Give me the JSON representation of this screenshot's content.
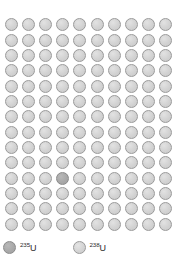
{
  "figure": {
    "grid": {
      "rows": 14,
      "columns": 10,
      "total_atoms": 140,
      "u235_count": 1,
      "u238_count": 139,
      "u235_position": {
        "row": 11,
        "column": 4
      },
      "u235_index": 103
    },
    "colors": {
      "u235_fill": "#a9a9a9",
      "u235_stroke": "#8a8a8a",
      "u238_fill": "#d4d4d4",
      "u238_stroke": "#9a9a9a",
      "background": "#ffffff",
      "text": "#2b2b2b"
    }
  },
  "legend": {
    "items": [
      {
        "id": "u235",
        "mass_number": "235",
        "symbol": "U",
        "kind": "u235"
      },
      {
        "id": "u238",
        "mass_number": "238",
        "symbol": "U",
        "kind": "u238"
      }
    ]
  },
  "chart_data": {
    "type": "pictogram",
    "unit": "1 circle = 1 atom out of 140",
    "categories": [
      "235U",
      "238U"
    ],
    "values": [
      1,
      139
    ],
    "percentages": [
      0.71,
      99.29
    ],
    "legend_position": "bottom-left",
    "grid": {
      "rows": 14,
      "columns": 10
    }
  }
}
